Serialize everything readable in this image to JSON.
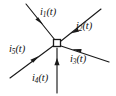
{
  "figure": {
    "kind": "circuit-node-diagram",
    "title": "",
    "background_color": "#ffffff",
    "line_color": "#1a1a1a",
    "text_color": "#111111",
    "node": {
      "name": "junction-node",
      "shape": "square",
      "x": 57,
      "y": 43,
      "size": 7,
      "fill": "#ffffff",
      "stroke": "#1a1a1a"
    },
    "branches": [
      {
        "id": "i1",
        "label_symbol": "i",
        "label_sub": "1",
        "label_arg": "(t)",
        "label_text": "i1(t)",
        "direction": "upper-left",
        "arrow_points": "toward-node",
        "from_x": 26,
        "from_y": 4,
        "to_x": 55,
        "to_y": 40,
        "arrow_x": 40,
        "arrow_y": 21
      },
      {
        "id": "i2",
        "label_symbol": "i",
        "label_sub": "2",
        "label_arg": "(t)",
        "label_text": "i2(t)",
        "direction": "upper-right",
        "arrow_points": "toward-node",
        "from_x": 101,
        "from_y": 9,
        "to_x": 61,
        "to_y": 41,
        "arrow_x": 74,
        "arrow_y": 31
      },
      {
        "id": "i3",
        "label_symbol": "i",
        "label_sub": "3",
        "label_arg": "(t)",
        "label_text": "i3(t)",
        "direction": "lower-right",
        "arrow_points": "toward-node",
        "from_x": 109,
        "from_y": 62,
        "to_x": 61,
        "to_y": 46,
        "arrow_x": 76,
        "arrow_y": 51
      },
      {
        "id": "i4",
        "label_symbol": "i",
        "label_sub": "4",
        "label_arg": "(t)",
        "label_text": "i4(t)",
        "direction": "down",
        "arrow_points": "toward-node",
        "from_x": 57,
        "from_y": 93,
        "to_x": 57,
        "to_y": 48,
        "arrow_x": 57,
        "arrow_y": 62
      },
      {
        "id": "i5",
        "label_symbol": "i",
        "label_sub": "5",
        "label_arg": "(t)",
        "label_text": "i5(t)",
        "direction": "lower-left",
        "arrow_points": "toward-node",
        "from_x": 10,
        "from_y": 78,
        "to_x": 53,
        "to_y": 46,
        "arrow_x": 34,
        "arrow_y": 60
      }
    ]
  }
}
